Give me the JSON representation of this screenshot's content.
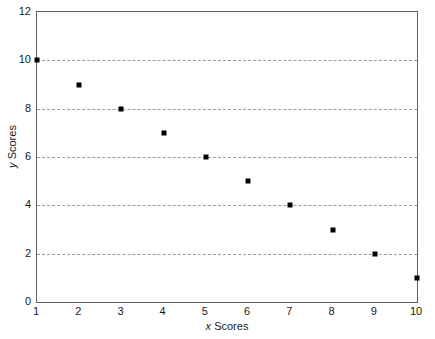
{
  "chart_data": {
    "type": "scatter",
    "title": "",
    "xlabel_var": "x",
    "xlabel_text": " Scores",
    "ylabel_var": "y",
    "ylabel_text": " Scores",
    "xlabel": "x Scores",
    "ylabel": "y Scores",
    "x": [
      1,
      2,
      3,
      4,
      5,
      6,
      7,
      8,
      9,
      10
    ],
    "values": [
      10,
      9,
      8,
      7,
      6,
      5,
      4,
      3,
      2,
      1
    ],
    "points": [
      {
        "x": 1,
        "y": 10
      },
      {
        "x": 2,
        "y": 9
      },
      {
        "x": 3,
        "y": 8
      },
      {
        "x": 4,
        "y": 7
      },
      {
        "x": 5,
        "y": 6
      },
      {
        "x": 6,
        "y": 5
      },
      {
        "x": 7,
        "y": 4
      },
      {
        "x": 8,
        "y": 3
      },
      {
        "x": 9,
        "y": 2
      },
      {
        "x": 10,
        "y": 1
      }
    ],
    "xlim": [
      1,
      10
    ],
    "ylim": [
      0,
      12
    ],
    "xticks": [
      1,
      2,
      3,
      4,
      5,
      6,
      7,
      8,
      9,
      10
    ],
    "xtick_labels": [
      "1",
      "2",
      "3",
      "4",
      "5",
      "6",
      "7",
      "8",
      "9",
      "10"
    ],
    "yticks": [
      0,
      2,
      4,
      6,
      8,
      10,
      12
    ],
    "ytick_labels": [
      "0",
      "2",
      "4",
      "6",
      "8",
      "10",
      "12"
    ],
    "gridlines_y": [
      2,
      4,
      6,
      8,
      10
    ],
    "grid": "horizontal-dashed",
    "legend": null,
    "legend_position": "none",
    "marker_shape": "square",
    "marker_color": "#000000",
    "grid_color": "#9a9a9a",
    "frame_color": "#606060",
    "background_color": "#ffffff"
  }
}
